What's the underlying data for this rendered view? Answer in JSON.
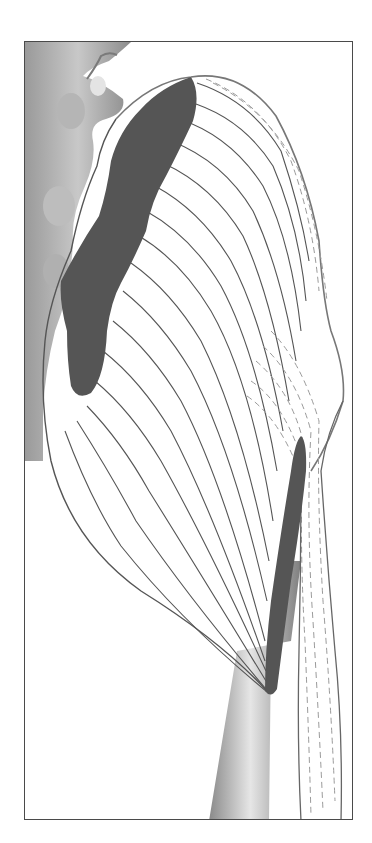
{
  "figure": {
    "colors": {
      "frame_border": "#4a4a4a",
      "origin_attachment": "#555555",
      "insertion_attachment": "#555555",
      "bone_light": "#d8d8d8",
      "bone_dark": "#8a8a8a",
      "fiber_line": "#555555",
      "tendon_dashed": "#9a9a9a",
      "background": "#ffffff"
    },
    "regions": [
      {
        "name": "sacrum-vertebrae",
        "label": ""
      },
      {
        "name": "origin-attachment",
        "label": ""
      },
      {
        "name": "muscle-fibers",
        "label": ""
      },
      {
        "name": "iliotibial-tract",
        "label": ""
      },
      {
        "name": "insertion-attachment",
        "label": ""
      },
      {
        "name": "femur-shaft",
        "label": ""
      }
    ]
  },
  "caption": {
    "text": ""
  }
}
